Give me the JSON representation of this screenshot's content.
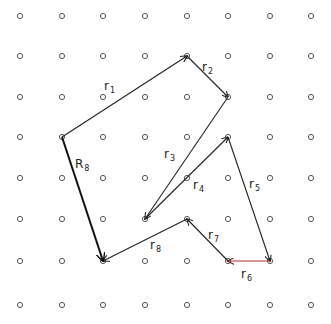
{
  "diagram": {
    "title": "",
    "grid": {
      "cols": [
        20,
        62,
        103,
        145,
        187,
        228,
        270,
        311
      ],
      "rows": [
        16,
        56,
        97,
        137,
        178,
        219,
        261,
        305
      ],
      "dot_radius": 2.6,
      "dot_color": "#555555"
    },
    "vectors": [
      {
        "id": "r1",
        "label": "r",
        "sub": "1",
        "from": [
          62,
          137
        ],
        "to": [
          187,
          56
        ],
        "color": "#222222",
        "width": 1.1,
        "label_pos": [
          104,
          90
        ]
      },
      {
        "id": "r2",
        "label": "r",
        "sub": "2",
        "from": [
          187,
          56
        ],
        "to": [
          228,
          97
        ],
        "color": "#222222",
        "width": 1.1,
        "label_pos": [
          202,
          71
        ]
      },
      {
        "id": "r3",
        "label": "r",
        "sub": "3",
        "from": [
          228,
          97
        ],
        "to": [
          145,
          219
        ],
        "color": "#222222",
        "width": 1.1,
        "label_pos": [
          164,
          158
        ]
      },
      {
        "id": "r4",
        "label": "r",
        "sub": "4",
        "from": [
          145,
          219
        ],
        "to": [
          228,
          137
        ],
        "color": "#222222",
        "width": 1.1,
        "label_pos": [
          193,
          189
        ]
      },
      {
        "id": "r5",
        "label": "r",
        "sub": "5",
        "from": [
          228,
          137
        ],
        "to": [
          270,
          261
        ],
        "color": "#222222",
        "width": 1.1,
        "label_pos": [
          249,
          188
        ]
      },
      {
        "id": "r6",
        "label": "r",
        "sub": "6",
        "from": [
          270,
          261
        ],
        "to": [
          228,
          261
        ],
        "color": "#b03030",
        "width": 1.1,
        "label_pos": [
          241,
          278
        ]
      },
      {
        "id": "r7",
        "label": "r",
        "sub": "7",
        "from": [
          228,
          261
        ],
        "to": [
          187,
          219
        ],
        "color": "#222222",
        "width": 1.1,
        "label_pos": [
          208,
          239
        ]
      },
      {
        "id": "r8",
        "label": "r",
        "sub": "8",
        "from": [
          187,
          219
        ],
        "to": [
          103,
          261
        ],
        "color": "#222222",
        "width": 1.1,
        "label_pos": [
          150,
          249
        ]
      },
      {
        "id": "R8",
        "label": "R",
        "sub": "8",
        "from": [
          62,
          137
        ],
        "to": [
          103,
          261
        ],
        "color": "#111111",
        "width": 2.0,
        "label_pos": [
          75,
          168
        ]
      }
    ]
  }
}
